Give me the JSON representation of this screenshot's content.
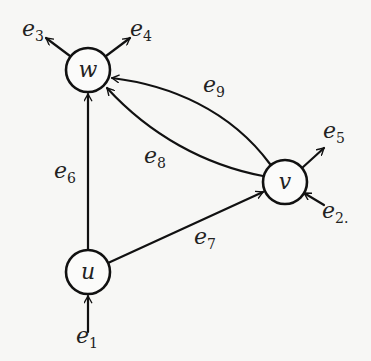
{
  "diagram": {
    "type": "directed-graph",
    "nodes": [
      {
        "id": "w",
        "label": "w",
        "cx": 88,
        "cy": 70,
        "r": 22
      },
      {
        "id": "v",
        "label": "v",
        "cx": 285,
        "cy": 182,
        "r": 22
      },
      {
        "id": "u",
        "label": "u",
        "cx": 88,
        "cy": 272,
        "r": 22
      }
    ],
    "edges": [
      {
        "id": "e1",
        "base": "e",
        "sub": "1",
        "from": "external",
        "to": "u",
        "label_x": 76,
        "label_y": 343
      },
      {
        "id": "e2",
        "base": "e",
        "sub": "2",
        "from": "external",
        "to": "v",
        "label_x": 322,
        "label_y": 218,
        "trailing": "."
      },
      {
        "id": "e3",
        "base": "e",
        "sub": "3",
        "from": "w",
        "to": "external",
        "label_x": 22,
        "label_y": 36
      },
      {
        "id": "e4",
        "base": "e",
        "sub": "4",
        "from": "w",
        "to": "external",
        "label_x": 130,
        "label_y": 36
      },
      {
        "id": "e5",
        "base": "e",
        "sub": "5",
        "from": "v",
        "to": "external",
        "label_x": 323,
        "label_y": 138
      },
      {
        "id": "e6",
        "base": "e",
        "sub": "6",
        "from": "u",
        "to": "w",
        "label_x": 54,
        "label_y": 178
      },
      {
        "id": "e7",
        "base": "e",
        "sub": "7",
        "from": "u",
        "to": "v",
        "label_x": 194,
        "label_y": 244
      },
      {
        "id": "e8",
        "base": "e",
        "sub": "8",
        "from": "v",
        "to": "w",
        "label_x": 144,
        "label_y": 163
      },
      {
        "id": "e9",
        "base": "e",
        "sub": "9",
        "from": "v",
        "to": "w",
        "label_x": 203,
        "label_y": 92
      }
    ]
  }
}
